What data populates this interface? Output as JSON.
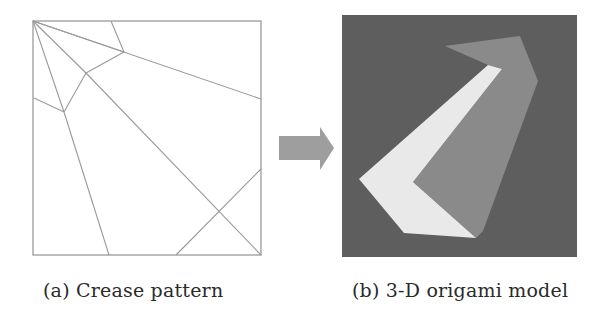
{
  "figure": {
    "panel_a": {
      "caption": "(a) Crease pattern",
      "square": {
        "x": 33,
        "y": 21,
        "w": 228,
        "h": 234
      },
      "stroke_color": "#9a9a9a",
      "creases": [
        [
          33,
          21,
          261,
          99
        ],
        [
          33,
          21,
          124,
          52
        ],
        [
          111,
          21,
          124,
          52
        ],
        [
          124,
          52,
          86,
          73
        ],
        [
          33,
          21,
          86,
          73
        ],
        [
          86,
          73,
          64,
          112
        ],
        [
          33,
          21,
          64,
          112
        ],
        [
          34,
          98,
          64,
          112
        ],
        [
          64,
          112,
          109,
          255
        ],
        [
          86,
          73,
          261,
          255
        ],
        [
          261,
          169,
          176,
          255
        ]
      ]
    },
    "arrow": {
      "color": "#9e9e9e",
      "points": "279,136 320,136 320,127 334,148 320,170 320,160 279,160"
    },
    "panel_b": {
      "caption": "(b) 3-D origami model",
      "background": {
        "x": 342,
        "y": 15,
        "w": 235,
        "h": 242,
        "color": "#5e5e5e"
      },
      "shapes": [
        {
          "name": "mid-gray-face",
          "color": "#8a8a8a",
          "points": "445,46 520,36 538,81 483,231 476,238 413,182 502,69 488,65"
        },
        {
          "name": "white-face",
          "color": "#e9e9e9",
          "points": "488,65 502,69 413,182 476,238 404,233 359,179"
        }
      ]
    }
  }
}
